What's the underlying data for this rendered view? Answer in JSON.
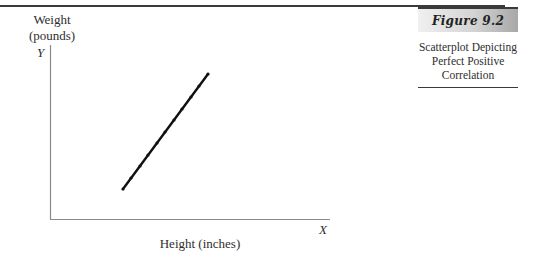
{
  "figure": {
    "number": "Figure 9.2",
    "caption": "Scatterplot Depicting Perfect Positive Correlation",
    "caption_lines": [
      "Scatterplot Depicting",
      "Perfect Positive",
      "Correlation"
    ]
  },
  "axes": {
    "y_label_line1": "Weight",
    "y_label_line2": "(pounds)",
    "y_letter": "Y",
    "x_label": "Height (inches)",
    "x_letter": "X"
  },
  "colors": {
    "line": "#111111",
    "axis": "#8a8a8a",
    "rule": "#3a3a3a"
  },
  "chart_data": {
    "type": "scatter",
    "title": "Scatterplot Depicting Perfect Positive Correlation",
    "figure_label": "Figure 9.2",
    "xlabel": "Height (inches)",
    "ylabel": "Weight (pounds)",
    "x_axis_symbol": "X",
    "y_axis_symbol": "Y",
    "x_ticks": [],
    "y_ticks": [],
    "grid": false,
    "legend": null,
    "points_px": [
      {
        "x": 123,
        "y": 189
      },
      {
        "x": 131,
        "y": 178
      },
      {
        "x": 140,
        "y": 166
      },
      {
        "x": 148,
        "y": 155
      },
      {
        "x": 157,
        "y": 143
      },
      {
        "x": 165,
        "y": 132
      },
      {
        "x": 174,
        "y": 120
      },
      {
        "x": 182,
        "y": 109
      },
      {
        "x": 191,
        "y": 97
      },
      {
        "x": 199,
        "y": 86
      },
      {
        "x": 208,
        "y": 74
      }
    ],
    "line": {
      "x1": 123,
      "y1": 189,
      "x2": 208,
      "y2": 74
    },
    "correlation": 1.0
  }
}
